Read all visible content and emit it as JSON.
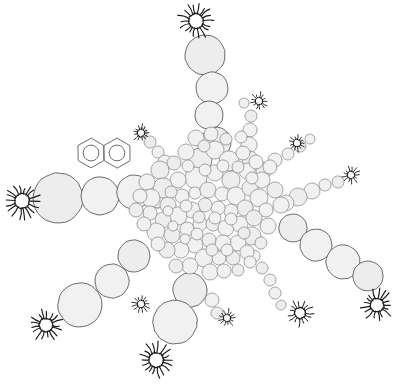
{
  "figure": {
    "background_color": "#ffffff",
    "width": 398,
    "height": 390,
    "style": "hand-drawn line art, light gray filled circles with thin dark outlines"
  },
  "palette": {
    "particle_fill": "#f1f1f1",
    "particle_fill_alt": "#ededed",
    "particle_stroke": "#5a5a5a",
    "particle_stroke_light": "#888888",
    "burst_stroke": "#1a1a1a",
    "molecule_stroke": "#6b6b6b",
    "background": "#ffffff"
  },
  "legend_note": {
    "core_label": "dense packed core",
    "arm_label": "radiating particle chains",
    "burst_label": "spiked terminal nodes",
    "molecule_label": "naphthalene aromatic ring pair"
  },
  "chart_data": {
    "type": "scatter",
    "xlabel": "",
    "ylabel": "",
    "xlim": [
      0,
      398
    ],
    "ylim": [
      0,
      390
    ],
    "grid": false,
    "legend_position": "none",
    "series": [
      {
        "name": "core-particles",
        "marker": "circle",
        "fill": "#f1f1f1",
        "stroke": "#5a5a5a",
        "points": [
          {
            "x": 200,
            "y": 160,
            "r": 12
          },
          {
            "x": 215,
            "y": 150,
            "r": 9
          },
          {
            "x": 186,
            "y": 152,
            "r": 8
          },
          {
            "x": 174,
            "y": 163,
            "r": 7
          },
          {
            "x": 229,
            "y": 161,
            "r": 10
          },
          {
            "x": 243,
            "y": 153,
            "r": 7
          },
          {
            "x": 160,
            "y": 170,
            "r": 9
          },
          {
            "x": 196,
            "y": 178,
            "r": 11
          },
          {
            "x": 215,
            "y": 173,
            "r": 8
          },
          {
            "x": 231,
            "y": 180,
            "r": 9
          },
          {
            "x": 247,
            "y": 171,
            "r": 8
          },
          {
            "x": 178,
            "y": 180,
            "r": 8
          },
          {
            "x": 163,
            "y": 188,
            "r": 10
          },
          {
            "x": 147,
            "y": 182,
            "r": 8
          },
          {
            "x": 151,
            "y": 198,
            "r": 9
          },
          {
            "x": 168,
            "y": 205,
            "r": 8
          },
          {
            "x": 182,
            "y": 196,
            "r": 7
          },
          {
            "x": 195,
            "y": 193,
            "r": 6
          },
          {
            "x": 208,
            "y": 190,
            "r": 8
          },
          {
            "x": 222,
            "y": 194,
            "r": 7
          },
          {
            "x": 236,
            "y": 196,
            "r": 9
          },
          {
            "x": 250,
            "y": 188,
            "r": 8
          },
          {
            "x": 262,
            "y": 180,
            "r": 8
          },
          {
            "x": 259,
            "y": 198,
            "r": 9
          },
          {
            "x": 245,
            "y": 208,
            "r": 8
          },
          {
            "x": 231,
            "y": 211,
            "r": 7
          },
          {
            "x": 218,
            "y": 208,
            "r": 7
          },
          {
            "x": 205,
            "y": 205,
            "r": 7
          },
          {
            "x": 192,
            "y": 210,
            "r": 8
          },
          {
            "x": 178,
            "y": 216,
            "r": 9
          },
          {
            "x": 163,
            "y": 220,
            "r": 8
          },
          {
            "x": 150,
            "y": 213,
            "r": 7
          },
          {
            "x": 156,
            "y": 232,
            "r": 9
          },
          {
            "x": 172,
            "y": 235,
            "r": 8
          },
          {
            "x": 187,
            "y": 229,
            "r": 7
          },
          {
            "x": 200,
            "y": 224,
            "r": 7
          },
          {
            "x": 213,
            "y": 224,
            "r": 7
          },
          {
            "x": 226,
            "y": 228,
            "r": 8
          },
          {
            "x": 240,
            "y": 224,
            "r": 8
          },
          {
            "x": 254,
            "y": 218,
            "r": 8
          },
          {
            "x": 266,
            "y": 210,
            "r": 7
          },
          {
            "x": 268,
            "y": 226,
            "r": 8
          },
          {
            "x": 252,
            "y": 236,
            "r": 9
          },
          {
            "x": 238,
            "y": 243,
            "r": 8
          },
          {
            "x": 223,
            "y": 243,
            "r": 8
          },
          {
            "x": 209,
            "y": 240,
            "r": 7
          },
          {
            "x": 195,
            "y": 245,
            "r": 8
          },
          {
            "x": 181,
            "y": 250,
            "r": 8
          },
          {
            "x": 167,
            "y": 250,
            "r": 8
          },
          {
            "x": 204,
            "y": 258,
            "r": 9
          },
          {
            "x": 219,
            "y": 258,
            "r": 7
          },
          {
            "x": 233,
            "y": 258,
            "r": 7
          },
          {
            "x": 247,
            "y": 252,
            "r": 7
          },
          {
            "x": 190,
            "y": 266,
            "r": 8
          },
          {
            "x": 176,
            "y": 266,
            "r": 7
          },
          {
            "x": 210,
            "y": 272,
            "r": 8
          },
          {
            "x": 224,
            "y": 271,
            "r": 7
          },
          {
            "x": 238,
            "y": 270,
            "r": 6
          },
          {
            "x": 196,
            "y": 138,
            "r": 8
          },
          {
            "x": 211,
            "y": 134,
            "r": 7
          },
          {
            "x": 226,
            "y": 139,
            "r": 6
          },
          {
            "x": 241,
            "y": 137,
            "r": 6
          },
          {
            "x": 188,
            "y": 166,
            "r": 6
          },
          {
            "x": 204,
            "y": 146,
            "r": 6
          },
          {
            "x": 256,
            "y": 162,
            "r": 7
          },
          {
            "x": 270,
            "y": 167,
            "r": 7
          },
          {
            "x": 275,
            "y": 190,
            "r": 8
          },
          {
            "x": 281,
            "y": 205,
            "r": 8
          },
          {
            "x": 140,
            "y": 196,
            "r": 7
          },
          {
            "x": 136,
            "y": 210,
            "r": 7
          },
          {
            "x": 144,
            "y": 224,
            "r": 7
          },
          {
            "x": 158,
            "y": 244,
            "r": 7
          },
          {
            "x": 171,
            "y": 192,
            "r": 6
          },
          {
            "x": 205,
            "y": 170,
            "r": 6
          },
          {
            "x": 223,
            "y": 166,
            "r": 6
          },
          {
            "x": 238,
            "y": 167,
            "r": 6
          },
          {
            "x": 252,
            "y": 178,
            "r": 6
          },
          {
            "x": 186,
            "y": 206,
            "r": 6
          },
          {
            "x": 199,
            "y": 217,
            "r": 6
          },
          {
            "x": 215,
            "y": 218,
            "r": 6
          },
          {
            "x": 231,
            "y": 219,
            "r": 6
          },
          {
            "x": 244,
            "y": 233,
            "r": 6
          },
          {
            "x": 197,
            "y": 234,
            "r": 6
          },
          {
            "x": 168,
            "y": 211,
            "r": 5
          },
          {
            "x": 212,
            "y": 250,
            "r": 6
          },
          {
            "x": 227,
            "y": 250,
            "r": 6
          },
          {
            "x": 185,
            "y": 239,
            "r": 5
          },
          {
            "x": 261,
            "y": 243,
            "r": 6
          },
          {
            "x": 173,
            "y": 226,
            "r": 5
          },
          {
            "x": 250,
            "y": 262,
            "r": 6
          }
        ]
      },
      {
        "name": "arm-north",
        "marker": "circle",
        "points": [
          {
            "x": 205,
            "y": 55,
            "r": 20
          },
          {
            "x": 212,
            "y": 88,
            "r": 16
          },
          {
            "x": 209,
            "y": 115,
            "r": 14
          },
          {
            "x": 216,
            "y": 142,
            "r": 15
          }
        ]
      },
      {
        "name": "arm-northeast-small",
        "marker": "circle",
        "points": [
          {
            "x": 251,
            "y": 116,
            "r": 6
          },
          {
            "x": 250,
            "y": 130,
            "r": 7
          },
          {
            "x": 249,
            "y": 145,
            "r": 8
          },
          {
            "x": 250,
            "y": 159,
            "r": 8
          },
          {
            "x": 244,
            "y": 103,
            "r": 5
          }
        ]
      },
      {
        "name": "arm-northeast-chain",
        "marker": "circle",
        "points": [
          {
            "x": 300,
            "y": 146,
            "r": 6
          },
          {
            "x": 288,
            "y": 154,
            "r": 6
          },
          {
            "x": 275,
            "y": 160,
            "r": 7
          },
          {
            "x": 264,
            "y": 170,
            "r": 8
          },
          {
            "x": 310,
            "y": 139,
            "r": 5
          }
        ]
      },
      {
        "name": "arm-east-small",
        "marker": "circle",
        "points": [
          {
            "x": 338,
            "y": 182,
            "r": 6
          },
          {
            "x": 325,
            "y": 185,
            "r": 6
          },
          {
            "x": 312,
            "y": 191,
            "r": 8
          },
          {
            "x": 298,
            "y": 197,
            "r": 9
          },
          {
            "x": 286,
            "y": 203,
            "r": 8
          }
        ]
      },
      {
        "name": "arm-east-large",
        "marker": "circle",
        "points": [
          {
            "x": 293,
            "y": 228,
            "r": 14
          },
          {
            "x": 316,
            "y": 245,
            "r": 16
          },
          {
            "x": 343,
            "y": 262,
            "r": 17
          },
          {
            "x": 368,
            "y": 276,
            "r": 15
          }
        ]
      },
      {
        "name": "arm-southeast-small",
        "marker": "circle",
        "points": [
          {
            "x": 262,
            "y": 268,
            "r": 6
          },
          {
            "x": 270,
            "y": 280,
            "r": 6
          },
          {
            "x": 275,
            "y": 293,
            "r": 6
          },
          {
            "x": 281,
            "y": 305,
            "r": 5
          },
          {
            "x": 254,
            "y": 256,
            "r": 6
          }
        ]
      },
      {
        "name": "arm-south",
        "marker": "circle",
        "points": [
          {
            "x": 190,
            "y": 290,
            "r": 17
          },
          {
            "x": 175,
            "y": 322,
            "r": 22
          },
          {
            "x": 212,
            "y": 300,
            "r": 7
          },
          {
            "x": 217,
            "y": 313,
            "r": 6
          }
        ]
      },
      {
        "name": "arm-southwest",
        "marker": "circle",
        "points": [
          {
            "x": 134,
            "y": 256,
            "r": 16
          },
          {
            "x": 112,
            "y": 281,
            "r": 17
          },
          {
            "x": 80,
            "y": 305,
            "r": 22
          }
        ]
      },
      {
        "name": "arm-west",
        "marker": "circle",
        "points": [
          {
            "x": 58,
            "y": 198,
            "r": 25
          },
          {
            "x": 100,
            "y": 196,
            "r": 19
          },
          {
            "x": 134,
            "y": 192,
            "r": 17
          },
          {
            "x": 158,
            "y": 196,
            "r": 12
          }
        ]
      },
      {
        "name": "arm-west-small",
        "marker": "circle",
        "points": [
          {
            "x": 150,
            "y": 142,
            "r": 6
          },
          {
            "x": 158,
            "y": 152,
            "r": 6
          },
          {
            "x": 165,
            "y": 162,
            "r": 7
          },
          {
            "x": 142,
            "y": 133,
            "r": 5
          }
        ]
      }
    ],
    "bursts": [
      {
        "name": "burst-north",
        "x": 196,
        "y": 21,
        "r": 12,
        "spikes": 18,
        "size": "large"
      },
      {
        "name": "burst-west",
        "x": 22,
        "y": 201,
        "r": 12,
        "spikes": 18,
        "size": "large"
      },
      {
        "name": "burst-southwest",
        "x": 46,
        "y": 325,
        "r": 11,
        "spikes": 17,
        "size": "large"
      },
      {
        "name": "burst-south",
        "x": 156,
        "y": 360,
        "r": 12,
        "spikes": 18,
        "size": "large"
      },
      {
        "name": "burst-southeast-far",
        "x": 377,
        "y": 305,
        "r": 11,
        "spikes": 17,
        "size": "large"
      },
      {
        "name": "burst-east-lower",
        "x": 300,
        "y": 313,
        "r": 9,
        "spikes": 15,
        "size": "medium"
      },
      {
        "name": "burst-center-south",
        "x": 227,
        "y": 318,
        "r": 6,
        "spikes": 13,
        "size": "small"
      },
      {
        "name": "burst-arm-southwest-tip",
        "x": 141,
        "y": 304,
        "r": 6,
        "spikes": 13,
        "size": "small"
      },
      {
        "name": "burst-northeast-upper",
        "x": 259,
        "y": 101,
        "r": 6,
        "spikes": 13,
        "size": "small"
      },
      {
        "name": "burst-northeast-outer",
        "x": 297,
        "y": 143,
        "r": 6,
        "spikes": 13,
        "size": "small"
      },
      {
        "name": "burst-east-outer",
        "x": 351,
        "y": 175,
        "r": 6,
        "spikes": 13,
        "size": "small"
      },
      {
        "name": "burst-northwest-small",
        "x": 141,
        "y": 133,
        "r": 6,
        "spikes": 13,
        "size": "small"
      }
    ],
    "molecules": [
      {
        "name": "naphthalene",
        "label": "naphthalene",
        "cx": 104,
        "cy": 153,
        "ring_radius": 15,
        "rings": 2,
        "aromatic_circle": true
      }
    ],
    "connectors": [
      {
        "from": "burst-north",
        "to": "arm-north-top",
        "x1": 198,
        "y1": 36,
        "x2": 203,
        "y2": 40
      }
    ]
  }
}
